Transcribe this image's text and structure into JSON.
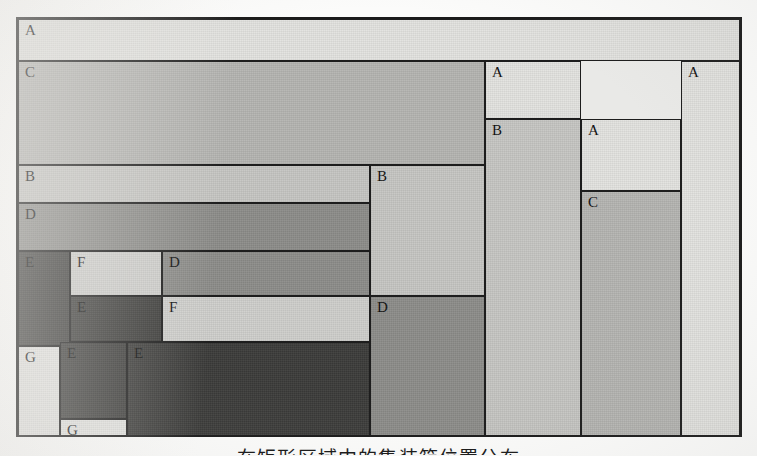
{
  "figure": {
    "caption": "在矩形区域中的集装箱位置分布",
    "frame": {
      "x": 16,
      "y": 17,
      "width": 726,
      "height": 420,
      "border_color": "#1b1b1b",
      "background": "#e9e9e7"
    },
    "page_background": "#fbfbfa",
    "legend_fills": {
      "A": "#e3e3e0",
      "B": "#c6c6c3",
      "C": "#b5b5b2",
      "D": "#8d8d8a",
      "E": "#3c3c3a",
      "F": "#cfcfcc",
      "G": "#e6e6e3"
    },
    "label_counts": {
      "A": 4,
      "B": 3,
      "C": 2,
      "D": 4,
      "E": 4,
      "F": 2,
      "G": 2
    },
    "cells": [
      {
        "id": "cell-a-top",
        "label": "A",
        "x": 0,
        "y": 0,
        "w": 722,
        "h": 42,
        "fill": "#e3e3e0",
        "dark": false
      },
      {
        "id": "cell-c-main",
        "label": "C",
        "x": 0,
        "y": 42,
        "w": 467,
        "h": 104,
        "fill": "#b5b5b2",
        "dark": false
      },
      {
        "id": "cell-b-left",
        "label": "B",
        "x": 0,
        "y": 146,
        "w": 352,
        "h": 38,
        "fill": "#c6c6c3",
        "dark": false
      },
      {
        "id": "cell-d-left",
        "label": "D",
        "x": 0,
        "y": 184,
        "w": 352,
        "h": 48,
        "fill": "#8d8d8a",
        "dark": false
      },
      {
        "id": "cell-e-tall",
        "label": "E",
        "x": 0,
        "y": 232,
        "w": 52,
        "h": 95,
        "fill": "#3c3c3a",
        "dark": true
      },
      {
        "id": "cell-f-upper",
        "label": "F",
        "x": 52,
        "y": 232,
        "w": 92,
        "h": 45,
        "fill": "#cfcfcc",
        "dark": false
      },
      {
        "id": "cell-d-mid",
        "label": "D",
        "x": 144,
        "y": 232,
        "w": 208,
        "h": 45,
        "fill": "#8d8d8a",
        "dark": false
      },
      {
        "id": "cell-e-mid",
        "label": "E",
        "x": 52,
        "y": 277,
        "w": 92,
        "h": 46,
        "fill": "#3c3c3a",
        "dark": true
      },
      {
        "id": "cell-f-lower",
        "label": "F",
        "x": 144,
        "y": 277,
        "w": 208,
        "h": 46,
        "fill": "#cfcfcc",
        "dark": false
      },
      {
        "id": "cell-g-left",
        "label": "G",
        "x": 0,
        "y": 327,
        "w": 42,
        "h": 93,
        "fill": "#e6e6e3",
        "dark": false
      },
      {
        "id": "cell-e-small",
        "label": "E",
        "x": 42,
        "y": 323,
        "w": 67,
        "h": 77,
        "fill": "#3c3c3a",
        "dark": true
      },
      {
        "id": "cell-g-bottom",
        "label": "G",
        "x": 42,
        "y": 400,
        "w": 67,
        "h": 20,
        "fill": "#e6e6e3",
        "dark": false
      },
      {
        "id": "cell-e-big",
        "label": "E",
        "x": 109,
        "y": 323,
        "w": 243,
        "h": 97,
        "fill": "#3c3c3a",
        "dark": true
      },
      {
        "id": "cell-b-mid",
        "label": "B",
        "x": 352,
        "y": 146,
        "w": 115,
        "h": 131,
        "fill": "#c6c6c3",
        "dark": false
      },
      {
        "id": "cell-d-right",
        "label": "D",
        "x": 352,
        "y": 277,
        "w": 115,
        "h": 143,
        "fill": "#8d8d8a",
        "dark": false
      },
      {
        "id": "cell-a-upper2",
        "label": "A",
        "x": 467,
        "y": 42,
        "w": 96,
        "h": 58,
        "fill": "#e3e3e0",
        "dark": false
      },
      {
        "id": "cell-b-right",
        "label": "B",
        "x": 467,
        "y": 100,
        "w": 96,
        "h": 320,
        "fill": "#c6c6c3",
        "dark": false
      },
      {
        "id": "cell-a-inner",
        "label": "A",
        "x": 563,
        "y": 100,
        "w": 100,
        "h": 72,
        "fill": "#e3e3e0",
        "dark": false
      },
      {
        "id": "cell-c-right",
        "label": "C",
        "x": 563,
        "y": 172,
        "w": 100,
        "h": 248,
        "fill": "#b5b5b2",
        "dark": false
      },
      {
        "id": "cell-a-farright",
        "label": "A",
        "x": 663,
        "y": 42,
        "w": 59,
        "h": 378,
        "fill": "#e3e3e0",
        "dark": false
      }
    ]
  }
}
